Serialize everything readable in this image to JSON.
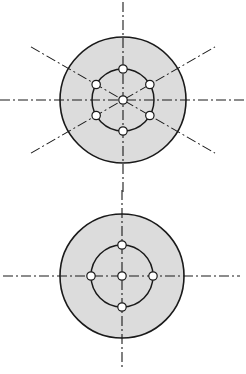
{
  "figure": {
    "colors": {
      "disk_fill": "#dcdcdc",
      "line": "#1a1a1a",
      "hole_fill": "#ffffff",
      "background": "#ffffff"
    },
    "diagrams": [
      {
        "id": "six-hole-pattern",
        "hole_count_on_pitch_circle": 6,
        "has_center_hole": true,
        "hole_angles_deg": [
          90,
          30,
          -30,
          -90,
          -150,
          150
        ],
        "center_line_angles_deg": [
          0,
          90,
          30,
          -30
        ]
      },
      {
        "id": "four-hole-pattern",
        "hole_count_on_pitch_circle": 4,
        "has_center_hole": true,
        "hole_angles_deg": [
          0,
          90,
          180,
          270
        ],
        "center_line_angles_deg": [
          0,
          90
        ]
      }
    ]
  }
}
